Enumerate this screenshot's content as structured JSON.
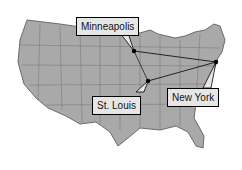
{
  "map": {
    "title": "United States",
    "colors": {
      "land": "#a9a9a9",
      "border": "#6a6a6a",
      "route": "#222222",
      "label_bg": "#e6e6e6"
    },
    "cities": [
      {
        "name": "Minneapolis",
        "x": 134,
        "y": 51
      },
      {
        "name": "St. Louis",
        "x": 148,
        "y": 81
      },
      {
        "name": "New York",
        "x": 216,
        "y": 62
      }
    ],
    "routes": [
      {
        "from": "Minneapolis",
        "to": "New York"
      },
      {
        "from": "St. Louis",
        "to": "New York"
      }
    ]
  }
}
